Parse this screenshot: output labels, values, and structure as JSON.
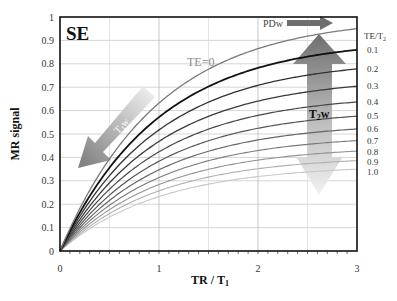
{
  "chart_data": {
    "type": "line",
    "title": "SE",
    "xlabel": "TR / T",
    "xlabel_sub": "1",
    "ylabel": "MR signal",
    "xlim": [
      0,
      3
    ],
    "ylim": [
      0,
      1
    ],
    "xticks": [
      "0",
      "1",
      "2",
      "3"
    ],
    "yticks": [
      "0",
      "0.1",
      "0.2",
      "0.3",
      "0.4",
      "0.5",
      "0.6",
      "0.7",
      "0.8",
      "0.9",
      "1"
    ],
    "grid": true,
    "formula": "S = (1 - exp(-TR/T1)) * exp(-TE/T2)",
    "legend_title": "TE/T",
    "legend_title_sub": "2",
    "curve_label_te0": "TE=0",
    "series": [
      {
        "name": "TE=0",
        "te_t2": 0.0,
        "color": "#7a7a7a",
        "width": 1.3,
        "label": ""
      },
      {
        "name": "0.1",
        "te_t2": 0.1,
        "color": "#111111",
        "width": 1.8,
        "label": "0.1"
      },
      {
        "name": "0.2",
        "te_t2": 0.2,
        "color": "#333333",
        "width": 1.3,
        "label": "0.2"
      },
      {
        "name": "0.3",
        "te_t2": 0.3,
        "color": "#3c3c3c",
        "width": 1.3,
        "label": "0.3"
      },
      {
        "name": "0.4",
        "te_t2": 0.4,
        "color": "#474747",
        "width": 1.2,
        "label": "0.4"
      },
      {
        "name": "0.5",
        "te_t2": 0.5,
        "color": "#555555",
        "width": 1.2,
        "label": "0.5"
      },
      {
        "name": "0.6",
        "te_t2": 0.6,
        "color": "#666666",
        "width": 1.2,
        "label": "0.6"
      },
      {
        "name": "0.7",
        "te_t2": 0.7,
        "color": "#7a7a7a",
        "width": 1.1,
        "label": "0.7"
      },
      {
        "name": "0.8",
        "te_t2": 0.8,
        "color": "#939393",
        "width": 1.1,
        "label": "0.8"
      },
      {
        "name": "0.9",
        "te_t2": 0.9,
        "color": "#b0b0b0",
        "width": 1.1,
        "label": "0.9"
      },
      {
        "name": "1.0",
        "te_t2": 1.0,
        "color": "#c8c8c8",
        "width": 1.1,
        "label": "1.0"
      }
    ],
    "end_values_at_x3": [
      0.95,
      0.86,
      0.778,
      0.704,
      0.637,
      0.576,
      0.521,
      0.472,
      0.427,
      0.386,
      0.35
    ],
    "annotations": [
      {
        "text": "T1w",
        "sub": "1",
        "type": "arrow",
        "direction": "down-left",
        "gradient": [
          "#f2f2f2",
          "#7d7d7d"
        ]
      },
      {
        "text": "PDw",
        "type": "arrow",
        "direction": "right",
        "color": "#6e6e6e"
      },
      {
        "text": "T2w",
        "sub": "2",
        "type": "double-arrow",
        "direction": "up-down",
        "gradient": [
          "#707070",
          "#ececec"
        ]
      }
    ]
  },
  "labels": {
    "title": "SE",
    "te0": "TE=0",
    "pdw": "PDw",
    "t1w_main": "T",
    "t1w_sub": "1",
    "t1w_w": "w",
    "t2w_main": "T",
    "t2w_sub": "2",
    "t2w_w": "w",
    "ylabel": "MR signal",
    "xlabel_main": "TR / T",
    "xlabel_sub": "1",
    "legend_main": "TE/T",
    "legend_sub": "2"
  }
}
